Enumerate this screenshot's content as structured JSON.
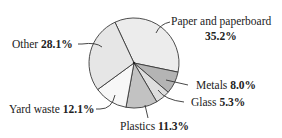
{
  "chart_data": {
    "type": "pie",
    "title": "",
    "start_angle_deg": -25,
    "direction": "clockwise",
    "slices": [
      {
        "label": "Paper and paperboard",
        "value": 35.2,
        "display": "35.2%",
        "color": "#ececec"
      },
      {
        "label": "Metals",
        "value": 8.0,
        "display": "8.0%",
        "color": "#b4b4b4"
      },
      {
        "label": "Glass",
        "value": 5.3,
        "display": "5.3%",
        "color": "#dedede"
      },
      {
        "label": "Plastics",
        "value": 11.3,
        "display": "11.3%",
        "color": "#c2c2c2"
      },
      {
        "label": "Yard waste",
        "value": 12.1,
        "display": "12.1%",
        "color": "#f7f7f7"
      },
      {
        "label": "Other",
        "value": 28.1,
        "display": "28.1%",
        "color": "#e6e6e6"
      }
    ]
  },
  "labels": {
    "paper": {
      "name": "Paper and paperboard",
      "value": "35.2%"
    },
    "metals": {
      "name": "Metals",
      "value": "8.0%"
    },
    "glass": {
      "name": "Glass",
      "value": "5.3%"
    },
    "plastics": {
      "name": "Plastics",
      "value": "11.3%"
    },
    "yard": {
      "name": "Yard waste",
      "value": "12.1%"
    },
    "other": {
      "name": "Other",
      "value": "28.1%"
    }
  }
}
